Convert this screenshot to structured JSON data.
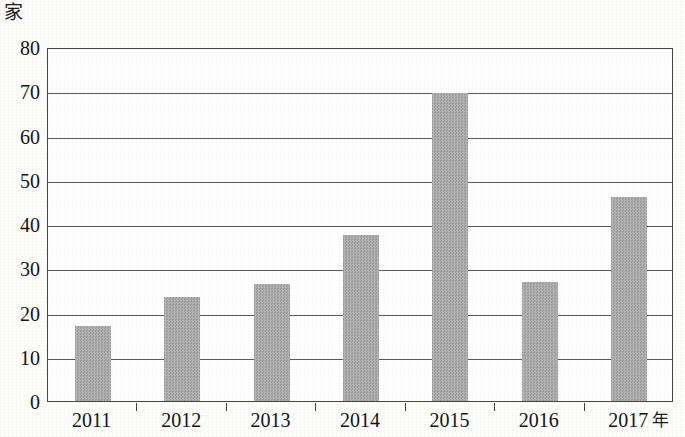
{
  "figure": {
    "y_unit_label": "家",
    "x_unit_label": "年",
    "frame_color": "#454545",
    "gridline_color": "#5a5a5a",
    "bar_fill_color": "#a9a9a9",
    "background_color": "#ffffff"
  },
  "chart_data": {
    "type": "bar",
    "title": "",
    "subtitle": "",
    "xlabel": "年",
    "ylabel": "家",
    "categories": [
      "2011",
      "2012",
      "2013",
      "2014",
      "2015",
      "2016",
      "2017"
    ],
    "values": [
      17,
      23.4,
      26.4,
      37.6,
      69.5,
      27,
      46
    ],
    "series": [
      {
        "name": "",
        "values": [
          17,
          23.4,
          26.4,
          37.6,
          69.5,
          27,
          46
        ]
      }
    ],
    "ylim": [
      0,
      80
    ],
    "ytick_labels": [
      "0",
      "10",
      "20",
      "30",
      "40",
      "50",
      "60",
      "70",
      "80"
    ],
    "ytick_values": [
      0,
      10,
      20,
      30,
      40,
      50,
      60,
      70,
      80
    ],
    "xtick_labels": [
      "2011",
      "2012",
      "2013",
      "2014",
      "2015",
      "2016",
      "2017"
    ],
    "grid": true,
    "grid_axis": "y",
    "legend": false,
    "legend_position": "none",
    "bar_color": "#a9a9a9",
    "annotations": []
  }
}
